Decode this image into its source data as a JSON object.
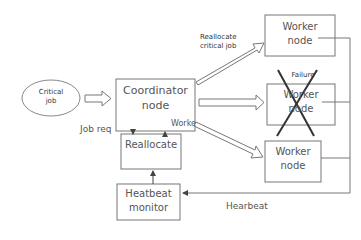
{
  "diagram": {
    "critical_job": {
      "line1": "Critical",
      "line2": "job"
    },
    "coordinator": {
      "line1": "Coordinator",
      "line2": "node"
    },
    "reallocate": {
      "label": "Reallocate"
    },
    "heartbeat_monitor": {
      "line1": "Heatbeat",
      "line2": "monitor"
    },
    "workers": [
      {
        "line1": "Worker",
        "line2": "node"
      },
      {
        "line1": "Worker",
        "line2": "node",
        "status": "Failure"
      },
      {
        "line1": "Worker",
        "line2": "node"
      }
    ],
    "edge_labels": {
      "reallocate_critical": {
        "line1": "Reallocate",
        "line2": "critical job"
      },
      "job_req": "Job req",
      "worker": "Worke",
      "heartbeat": "Hearbeat"
    },
    "colors": {
      "stroke": "#777777",
      "cross": "#333333",
      "text": "#555555"
    }
  }
}
